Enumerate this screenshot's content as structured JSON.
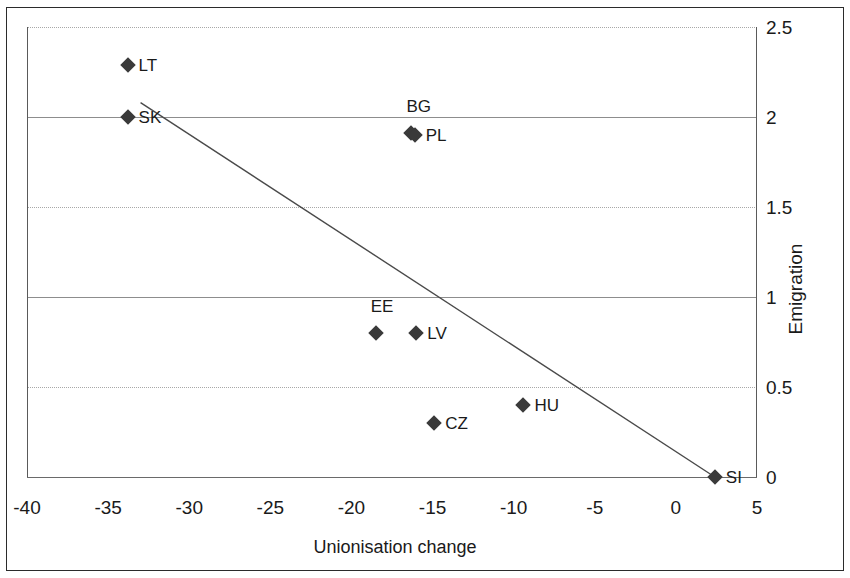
{
  "chart_data": {
    "type": "scatter",
    "title": "",
    "xlabel": "Unionisation change",
    "ylabel": "Emigration",
    "xlim": [
      -40,
      5
    ],
    "ylim": [
      0,
      2.5
    ],
    "xticks": [
      "-40",
      "-35",
      "-30",
      "-25",
      "-20",
      "-15",
      "-10",
      "-5",
      "0",
      "5"
    ],
    "xtick_values": [
      -40,
      -35,
      -30,
      -25,
      -20,
      -15,
      -10,
      -5,
      0,
      5
    ],
    "yticks": [
      "0",
      "0.5",
      "1",
      "1.5",
      "2",
      "2.5"
    ],
    "ytick_values": [
      0,
      0.5,
      1,
      1.5,
      2,
      2.5
    ],
    "y_axis_position": "right",
    "grid": "horizontal",
    "legend": "none",
    "points": [
      {
        "label": "LT",
        "x": -33.8,
        "y": 2.29,
        "label_side": "right"
      },
      {
        "label": "SK",
        "x": -33.8,
        "y": 2.0,
        "label_side": "right"
      },
      {
        "label": "BG",
        "x": -16.3,
        "y": 1.91,
        "label_side": "above"
      },
      {
        "label": "PL",
        "x": -16.1,
        "y": 1.9,
        "label_side": "right"
      },
      {
        "label": "EE",
        "x": -18.5,
        "y": 0.8,
        "label_side": "above"
      },
      {
        "label": "LV",
        "x": -16.0,
        "y": 0.8,
        "label_side": "right"
      },
      {
        "label": "HU",
        "x": -9.4,
        "y": 0.4,
        "label_side": "right"
      },
      {
        "label": "CZ",
        "x": -14.9,
        "y": 0.3,
        "label_side": "right"
      },
      {
        "label": "SI",
        "x": 2.4,
        "y": 0.0,
        "label_side": "right"
      }
    ],
    "trendline": {
      "x_start": -33.0,
      "y_start": 2.08,
      "x_end": 2.4,
      "y_end": 0.0
    },
    "colors": {
      "marker": "#3a3a3a",
      "trendline": "#4a4a4a",
      "gridline": "#8d8d8d",
      "text": "#1a1a1a",
      "background": "#ffffff"
    }
  }
}
